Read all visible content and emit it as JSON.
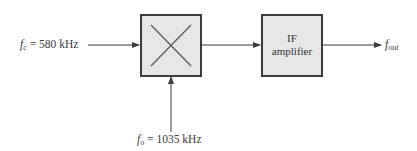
{
  "diagram": {
    "type": "block-diagram",
    "title": "",
    "input": {
      "symbol": "f",
      "subscript": "c",
      "equals": "=",
      "value": "580 kHz"
    },
    "oscillator": {
      "symbol": "f",
      "subscript": "o",
      "equals": "=",
      "value": "1035 kHz"
    },
    "mixer": {
      "label": "",
      "icon": "multiply-cross-icon"
    },
    "amplifier": {
      "line1": "IF",
      "line2": "amplifier"
    },
    "output": {
      "symbol": "f",
      "subscript": "out"
    },
    "colors": {
      "box_fill": "#e6e6e6",
      "line": "#3c3c3c",
      "text": "#3a3a3a"
    }
  }
}
